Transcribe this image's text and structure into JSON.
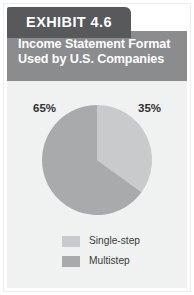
{
  "exhibit": {
    "tab_label": "EXHIBIT 4.6",
    "title_line1": "Income Statement Format",
    "title_line2": "Used by U.S. Companies"
  },
  "colors": {
    "tab_background": "#58595b",
    "title_band": "#8a8c8e",
    "panel_background": "#f0f1f1",
    "slice_single_step": "#c9cacb",
    "slice_multistep": "#a8aaac",
    "label_text": "#2f3031",
    "title_text": "#ffffff"
  },
  "legend": {
    "items": [
      {
        "label": "Single-step",
        "color": "#c9cacb"
      },
      {
        "label": "Multistep",
        "color": "#a8aaac"
      }
    ]
  },
  "pie": {
    "label_left": "65%",
    "label_right": "35%"
  },
  "chart_data": {
    "type": "pie",
    "title": "Income Statement Format Used by U.S. Companies",
    "subtitle": "",
    "categories": [
      "Single-step",
      "Multistep"
    ],
    "values": [
      35,
      65
    ],
    "value_unit": "percent",
    "data_labels": [
      "35%",
      "65%"
    ],
    "colors": [
      "#c9cacb",
      "#a8aaac"
    ],
    "start_angle_deg": 0,
    "direction": "clockwise",
    "legend_position": "bottom",
    "grid": false,
    "xlabel": "",
    "ylabel": ""
  }
}
